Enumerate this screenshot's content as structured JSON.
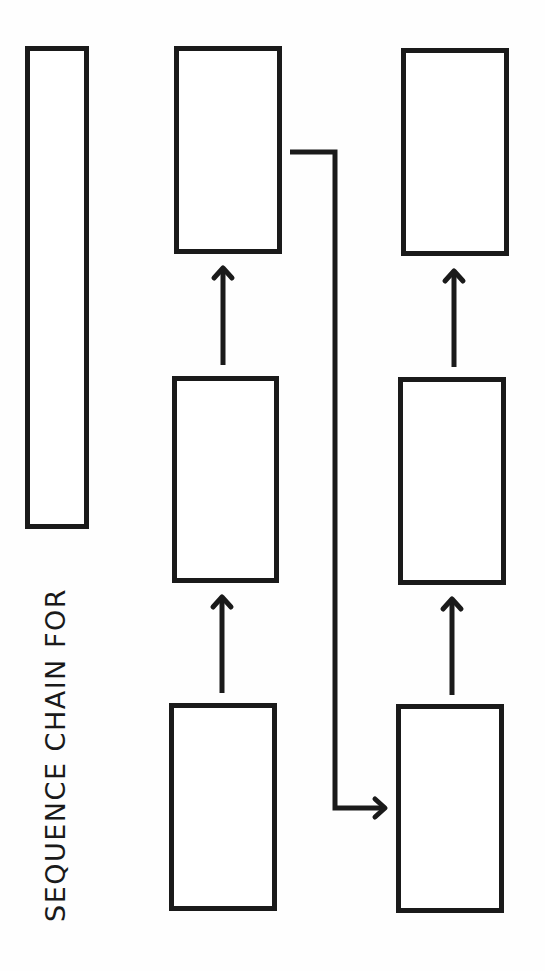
{
  "worksheet": {
    "title": "SEQUENCE CHAIN FOR",
    "title_box_value": "",
    "line_color": "#1a1a1a",
    "background_color": "#ffffff",
    "chains": [
      {
        "name": "left-column",
        "boxes": [
          {
            "position": "bottom",
            "value": ""
          },
          {
            "position": "middle",
            "value": ""
          },
          {
            "position": "top",
            "value": ""
          }
        ]
      },
      {
        "name": "right-column",
        "boxes": [
          {
            "position": "bottom",
            "value": ""
          },
          {
            "position": "middle",
            "value": ""
          },
          {
            "position": "top",
            "value": ""
          }
        ]
      }
    ],
    "arrows": [
      {
        "from": "left-column.bottom",
        "to": "left-column.middle",
        "direction": "up"
      },
      {
        "from": "left-column.middle",
        "to": "left-column.top",
        "direction": "up"
      },
      {
        "from": "left-column.top",
        "to": "right-column.bottom",
        "direction": "connector-right"
      },
      {
        "from": "right-column.bottom",
        "to": "right-column.middle",
        "direction": "up"
      },
      {
        "from": "right-column.middle",
        "to": "right-column.top",
        "direction": "up"
      }
    ]
  }
}
